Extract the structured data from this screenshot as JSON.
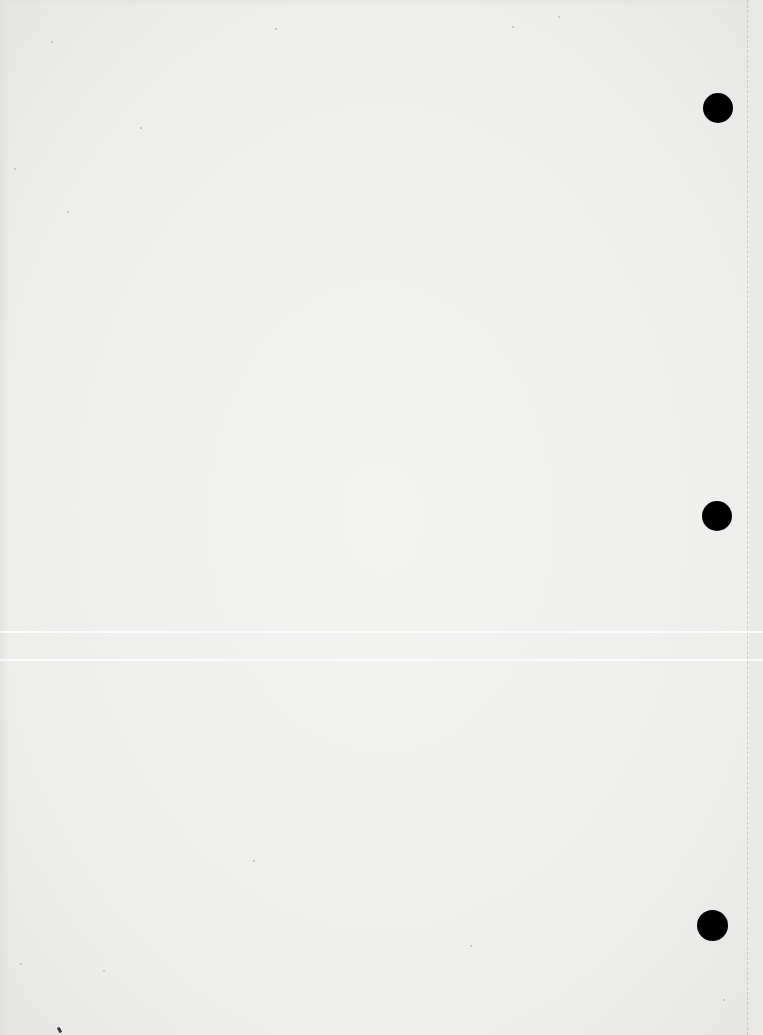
{
  "document": {
    "type": "blank scanned page",
    "text_content": "",
    "paper_color": "#f0f0ee"
  },
  "punch_holes": [
    {
      "position": "top",
      "x": 703,
      "y": 93,
      "diameter": 30,
      "color": "#000000"
    },
    {
      "position": "middle",
      "x": 702,
      "y": 501,
      "diameter": 30,
      "color": "#000000"
    },
    {
      "position": "bottom",
      "x": 697,
      "y": 910,
      "diameter": 31,
      "color": "#000000"
    }
  ],
  "perforation_line": {
    "x": 747,
    "style": "dashed",
    "color": "#c9c9c7"
  },
  "scan_bands": [
    {
      "y": 631
    },
    {
      "y": 659
    }
  ],
  "specks": [
    {
      "x": 51,
      "y": 41,
      "dark": false
    },
    {
      "x": 14,
      "y": 168,
      "dark": false
    },
    {
      "x": 67,
      "y": 211,
      "dark": false
    },
    {
      "x": 275,
      "y": 28,
      "dark": false
    },
    {
      "x": 512,
      "y": 26,
      "dark": false
    },
    {
      "x": 558,
      "y": 16,
      "dark": false
    },
    {
      "x": 140,
      "y": 127,
      "dark": false
    },
    {
      "x": 253,
      "y": 860,
      "dark": false
    },
    {
      "x": 20,
      "y": 963,
      "dark": false
    },
    {
      "x": 103,
      "y": 970,
      "dark": false
    },
    {
      "x": 723,
      "y": 999,
      "dark": false
    },
    {
      "x": 470,
      "y": 945,
      "dark": false
    },
    {
      "x": 58,
      "y": 1027,
      "dark": true
    }
  ]
}
